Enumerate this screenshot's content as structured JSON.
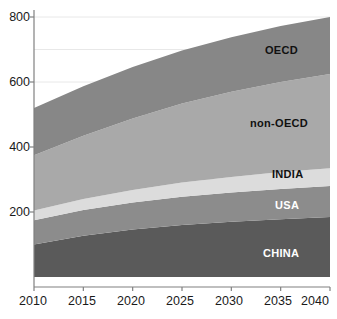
{
  "chart_data": {
    "type": "area",
    "title": "",
    "subtitle": "",
    "xlabel": "",
    "ylabel": "",
    "stacked": true,
    "grid": true,
    "legend_position": "inline-labels",
    "x": [
      2010,
      2015,
      2020,
      2025,
      2030,
      2035,
      2040
    ],
    "xlim": [
      2010,
      2040
    ],
    "ylim": [
      0,
      800
    ],
    "xticklabels": [
      "2010",
      "2015",
      "2020",
      "2025",
      "2030",
      "2035",
      "2040"
    ],
    "yticklabels": [
      "200",
      "400",
      "600",
      "800"
    ],
    "yticks": [
      200,
      400,
      600,
      800
    ],
    "gridlines": [
      100,
      300,
      500,
      700
    ],
    "series": [
      {
        "name": "CHINA",
        "color": "#5a5a5a",
        "label_color": "#ffffff",
        "values": [
          100,
          127,
          146,
          160,
          170,
          178,
          185
        ]
      },
      {
        "name": "USA",
        "color": "#8c8c8c",
        "label_color": "#ffffff",
        "values": [
          75,
          79,
          83,
          87,
          90,
          93,
          95
        ]
      },
      {
        "name": "INDIA",
        "color": "#dcdcdc",
        "label_color": "#111111",
        "values": [
          30,
          34,
          39,
          44,
          48,
          52,
          55
        ]
      },
      {
        "name": "non-OECD",
        "color": "#a9a9a9",
        "label_color": "#111111",
        "values": [
          170,
          195,
          220,
          243,
          262,
          277,
          290
        ]
      },
      {
        "name": "OECD",
        "color": "#878787",
        "label_color": "#111111",
        "values": [
          145,
          152,
          158,
          163,
          168,
          172,
          175
        ]
      }
    ],
    "cumulative_totals": [
      520,
      587,
      646,
      697,
      738,
      772,
      800
    ],
    "axis_color": "#808080",
    "grid_color": "#e8e8e8",
    "background": "#ffffff"
  },
  "labels": {
    "oecd": "OECD",
    "non_oecd": "non-OECD",
    "india": "INDIA",
    "usa": "USA",
    "china": "CHINA"
  },
  "yticks": {
    "t800": "800",
    "t600": "600",
    "t400": "400",
    "t200": "200"
  },
  "xticks": {
    "t2010": "2010",
    "t2015": "2015",
    "t2020": "2020",
    "t2025": "2025",
    "t2030": "2030",
    "t2035": "2035",
    "t2040": "2040"
  }
}
